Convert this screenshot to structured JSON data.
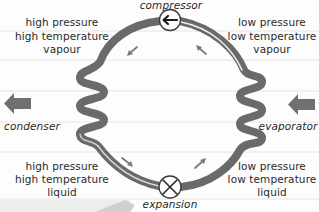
{
  "diagram": {
    "components": {
      "compressor": {
        "label": "compressor",
        "icon": "arrow-left-in-circle"
      },
      "expansion": {
        "label": "expansion",
        "icon": "x-in-circle"
      },
      "condenser": {
        "label": "condenser",
        "arrow_direction": "left"
      },
      "evaporator": {
        "label": "evaporator",
        "arrow_direction": "left"
      }
    },
    "states": {
      "top_left": [
        "high pressure",
        "high temperature",
        "vapour"
      ],
      "top_right": [
        "low pressure",
        "low temperature",
        "vapour"
      ],
      "bottom_left": [
        "high pressure",
        "high temperature",
        "liquid"
      ],
      "bottom_right": [
        "low pressure",
        "low temperature",
        "liquid"
      ]
    },
    "flow_direction": "counter-clockwise",
    "colors": {
      "pipe": "#6b6b6b",
      "pipe_highlight": "#e9e9e9",
      "text": "#2a2a2a",
      "arrow": "#7a7a7a",
      "background_lines": "#e2e2e2"
    }
  }
}
